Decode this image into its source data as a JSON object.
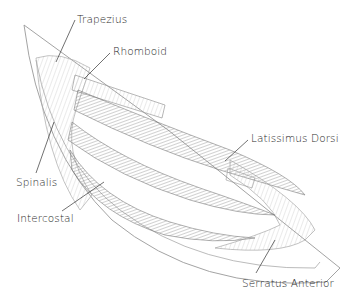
{
  "diagram": {
    "labels": [
      {
        "id": "trapezius",
        "text": "Trapezius",
        "x": 77,
        "y": 14
      },
      {
        "id": "rhomboid",
        "text": "Rhomboid",
        "x": 113,
        "y": 46
      },
      {
        "id": "latissimus-dorsi",
        "text": "Latissimus Dorsi",
        "x": 251,
        "y": 133
      },
      {
        "id": "spinalis",
        "text": "Spinalis",
        "x": 16,
        "y": 177
      },
      {
        "id": "intercostal",
        "text": "Intercostal",
        "x": 17,
        "y": 213
      },
      {
        "id": "serratus-anterior",
        "text": "Serratus Anterior",
        "x": 242,
        "y": 278
      }
    ],
    "colors": {
      "outline": "#8a8a8a",
      "hatch": "#6b6b6b",
      "text": "#2a2a2a",
      "background": "#ffffff"
    }
  }
}
